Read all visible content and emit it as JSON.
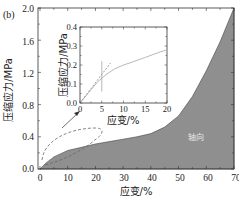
{
  "panel_label": "(b)",
  "colors": {
    "fill": "#8f8f8f",
    "axis": "#333333",
    "inset_curve": "#b0b0b0",
    "dashed": "#666666"
  },
  "chart_data": [
    {
      "type": "area",
      "title": "",
      "xlabel": "应变/%",
      "ylabel": "压缩应力/MPa",
      "xlim": [
        0,
        70
      ],
      "ylim": [
        0,
        2.0
      ],
      "xticks": [
        "0",
        "10",
        "20",
        "30",
        "40",
        "50",
        "60",
        "70"
      ],
      "yticks": [
        "0.0",
        "0.4",
        "0.8",
        "1.2",
        "1.6",
        "2.0"
      ],
      "grid": false,
      "series": [
        {
          "name": "轴向",
          "x": [
            0,
            2,
            5,
            10,
            15,
            20,
            25,
            30,
            35,
            40,
            45,
            50,
            55,
            60,
            65,
            70
          ],
          "y": [
            0,
            0.07,
            0.15,
            0.23,
            0.27,
            0.31,
            0.34,
            0.37,
            0.4,
            0.44,
            0.52,
            0.66,
            0.9,
            1.22,
            1.58,
            2.0
          ]
        }
      ],
      "annotations": [
        {
          "text": "轴向",
          "x": 57,
          "y": 0.45
        },
        {
          "text": "dashed ellipse highlighting 0–20% strain region",
          "x": 10,
          "y": 0.2
        },
        {
          "text": "arrow pointing to inset",
          "from": [
            5,
            0.55
          ],
          "to": [
            12,
            0.9
          ]
        }
      ]
    },
    {
      "type": "line",
      "title": "inset",
      "xlabel": "应变/%",
      "ylabel": "压缩应力/MPa",
      "xlim": [
        0,
        20
      ],
      "ylim": [
        0,
        0.4
      ],
      "xticks": [
        "0",
        "5",
        "10",
        "15",
        "20"
      ],
      "yticks": [
        "0.0",
        "0.1",
        "0.2",
        "0.3",
        "0.4"
      ],
      "grid": false,
      "series": [
        {
          "name": "curve",
          "x": [
            0,
            2,
            4,
            5,
            6,
            8,
            10,
            12,
            15,
            18,
            20
          ],
          "y": [
            0,
            0.055,
            0.11,
            0.13,
            0.15,
            0.18,
            0.2,
            0.215,
            0.24,
            0.265,
            0.28
          ]
        },
        {
          "name": "tangent (dashed)",
          "x": [
            0,
            7
          ],
          "y": [
            0,
            0.21
          ]
        },
        {
          "name": "yield marker (vertical)",
          "x": [
            5,
            5
          ],
          "y": [
            0.06,
            0.22
          ]
        }
      ]
    }
  ],
  "main": {
    "xlabel": "应变/%",
    "ylabel": "压缩应力/MPa",
    "xticks": [
      "0",
      "10",
      "20",
      "30",
      "40",
      "50",
      "60",
      "70"
    ],
    "yticks": [
      "0.0",
      "0.4",
      "0.8",
      "1.2",
      "1.6",
      "2.0"
    ],
    "region_label": "轴向"
  },
  "inset": {
    "xlabel": "应变/%",
    "ylabel": "压缩应力/MPa",
    "xticks": [
      "0",
      "5",
      "10",
      "15",
      "20"
    ],
    "yticks": [
      "0.0",
      "0.1",
      "0.2",
      "0.3",
      "0.4"
    ]
  }
}
